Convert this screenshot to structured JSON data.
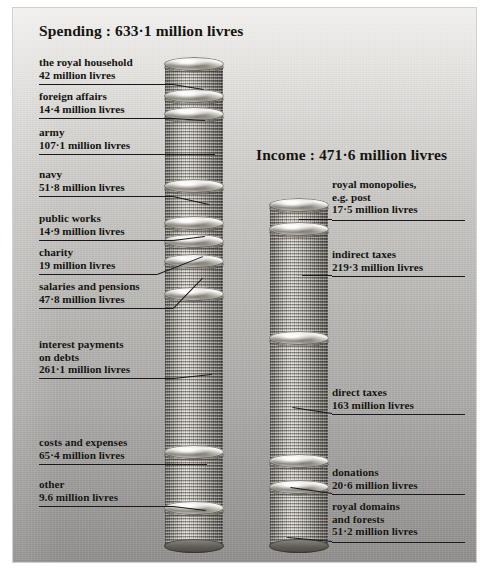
{
  "figure": {
    "background_color": "#bfbebb",
    "ink_color": "#17161b"
  },
  "spending": {
    "title": "Spending : 633·1 million livres",
    "total": 633.1,
    "unit": "million livres",
    "items": [
      {
        "label": "the royal household",
        "amount": "42 million livres",
        "value": 42
      },
      {
        "label": "foreign affairs",
        "amount": "14·4 million livres",
        "value": 14.4
      },
      {
        "label": "army",
        "amount": "107·1 million livres",
        "value": 107.1
      },
      {
        "label": "navy",
        "amount": "51·8 million livres",
        "value": 51.8
      },
      {
        "label": "public works",
        "amount": "14·9 million livres",
        "value": 14.9
      },
      {
        "label": "charity",
        "amount": "19 million livres",
        "value": 19
      },
      {
        "label": "salaries and pensions",
        "amount": "47·8 million livres",
        "value": 47.8
      },
      {
        "label": "interest payments\non debts",
        "amount": "261·1 million livres",
        "value": 261.1
      },
      {
        "label": "costs and expenses",
        "amount": "65·4 million livres",
        "value": 65.4
      },
      {
        "label": "other",
        "amount": "9.6 million livres",
        "value": 9.6
      }
    ]
  },
  "income": {
    "title": "Income : 471·6 million livres",
    "total": 471.6,
    "unit": "million livres",
    "items": [
      {
        "label": "royal monopolies,\ne.g. post",
        "amount": "17·5 million livres",
        "value": 17.5
      },
      {
        "label": "indirect taxes",
        "amount": "219·3 million livres",
        "value": 219.3
      },
      {
        "label": "direct taxes",
        "amount": "163 million livres",
        "value": 163
      },
      {
        "label": "donations",
        "amount": "20·6 million livres",
        "value": 20.6
      },
      {
        "label": "royal domains\nand forests",
        "amount": "51·2 million livres",
        "value": 51.2
      }
    ]
  },
  "chart_data": {
    "type": "bar",
    "subtype": "stacked-coin-columns",
    "unit": "million livres",
    "series": [
      {
        "name": "Spending : 633·1 million livres",
        "total": 633.1,
        "categories": [
          "the royal household",
          "foreign affairs",
          "army",
          "navy",
          "public works",
          "charity",
          "salaries and pensions",
          "interest payments on debts",
          "costs and expenses",
          "other"
        ],
        "values": [
          42,
          14.4,
          107.1,
          51.8,
          14.9,
          19,
          47.8,
          261.1,
          65.4,
          9.6
        ]
      },
      {
        "name": "Income : 471·6 million livres",
        "total": 471.6,
        "categories": [
          "royal monopolies, e.g. post",
          "indirect taxes",
          "direct taxes",
          "donations",
          "royal domains and forests"
        ],
        "values": [
          17.5,
          219.3,
          163,
          20.6,
          51.2
        ]
      }
    ],
    "xlabel": "",
    "ylabel": "million livres",
    "grid": false,
    "legend": "none"
  }
}
